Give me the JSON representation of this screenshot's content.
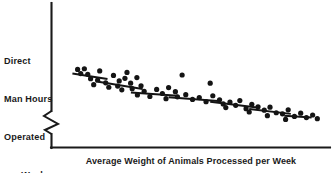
{
  "figure": {
    "background_color": "#ffffff",
    "ink_color": "#141414"
  },
  "axes": {
    "y_axis_label_lines": [
      "Direct",
      "Man Hours",
      "Operated",
      "per Week"
    ],
    "y_axis_label_full": "Direct Man Hours Operated per Week",
    "x_axis_label": "Average Weight of Animals Processed per Week",
    "y_axis_break_symbol": "zigzag",
    "y_axis_break_present": true,
    "tick_labels_x": [],
    "tick_labels_y": [],
    "grid": false
  },
  "chart_data": {
    "type": "scatter",
    "title": "",
    "xlabel": "Average Weight of Animals Processed per Week",
    "ylabel": "Direct Man Hours Operated per Week",
    "xlim": [
      0,
      100
    ],
    "ylim": [
      0,
      100
    ],
    "grid": false,
    "legend": "none",
    "axis_scale_note": "Axes are unlabeled; values are relative positions (0-100) read off the plotted pixels.",
    "relationship": "negative",
    "points": [
      {
        "x": 6.0,
        "y": 84.5
      },
      {
        "x": 8.6,
        "y": 85.5
      },
      {
        "x": 7.2,
        "y": 79.0
      },
      {
        "x": 9.9,
        "y": 78.0
      },
      {
        "x": 14.5,
        "y": 82.5
      },
      {
        "x": 11.0,
        "y": 72.0
      },
      {
        "x": 13.7,
        "y": 70.0
      },
      {
        "x": 12.2,
        "y": 64.0
      },
      {
        "x": 16.8,
        "y": 66.5
      },
      {
        "x": 19.8,
        "y": 76.5
      },
      {
        "x": 22.0,
        "y": 69.0
      },
      {
        "x": 25.0,
        "y": 80.5
      },
      {
        "x": 18.0,
        "y": 60.5
      },
      {
        "x": 21.4,
        "y": 62.0
      },
      {
        "x": 24.2,
        "y": 72.5
      },
      {
        "x": 26.4,
        "y": 66.0
      },
      {
        "x": 28.8,
        "y": 73.5
      },
      {
        "x": 23.0,
        "y": 57.0
      },
      {
        "x": 27.0,
        "y": 58.5
      },
      {
        "x": 30.4,
        "y": 62.5
      },
      {
        "x": 31.6,
        "y": 55.0
      },
      {
        "x": 29.0,
        "y": 50.0
      },
      {
        "x": 33.8,
        "y": 48.0
      },
      {
        "x": 36.4,
        "y": 57.5
      },
      {
        "x": 38.6,
        "y": 52.0
      },
      {
        "x": 41.0,
        "y": 60.0
      },
      {
        "x": 43.6,
        "y": 54.5
      },
      {
        "x": 46.2,
        "y": 77.0
      },
      {
        "x": 40.0,
        "y": 45.0
      },
      {
        "x": 44.4,
        "y": 47.5
      },
      {
        "x": 47.6,
        "y": 50.5
      },
      {
        "x": 50.2,
        "y": 44.0
      },
      {
        "x": 52.8,
        "y": 46.5
      },
      {
        "x": 55.4,
        "y": 41.0
      },
      {
        "x": 58.0,
        "y": 49.0
      },
      {
        "x": 57.0,
        "y": 66.0
      },
      {
        "x": 60.6,
        "y": 43.5
      },
      {
        "x": 62.0,
        "y": 38.0
      },
      {
        "x": 64.6,
        "y": 40.5
      },
      {
        "x": 63.0,
        "y": 33.0
      },
      {
        "x": 66.8,
        "y": 36.0
      },
      {
        "x": 68.4,
        "y": 42.5
      },
      {
        "x": 70.8,
        "y": 31.5
      },
      {
        "x": 73.0,
        "y": 37.5
      },
      {
        "x": 75.4,
        "y": 34.0
      },
      {
        "x": 72.0,
        "y": 27.0
      },
      {
        "x": 77.8,
        "y": 29.5
      },
      {
        "x": 80.0,
        "y": 33.5
      },
      {
        "x": 82.4,
        "y": 26.0
      },
      {
        "x": 79.0,
        "y": 22.0
      },
      {
        "x": 84.8,
        "y": 24.5
      },
      {
        "x": 87.0,
        "y": 30.0
      },
      {
        "x": 89.4,
        "y": 21.0
      },
      {
        "x": 86.0,
        "y": 17.0
      },
      {
        "x": 91.8,
        "y": 25.5
      },
      {
        "x": 94.0,
        "y": 19.5
      },
      {
        "x": 96.4,
        "y": 23.0
      },
      {
        "x": 98.2,
        "y": 18.0
      }
    ],
    "trend_segments": [
      {
        "x1": 4.0,
        "y1": 79.0,
        "x2": 17.5,
        "y2": 71.5
      },
      {
        "x1": 14.0,
        "y1": 68.0,
        "x2": 31.0,
        "y2": 58.0
      },
      {
        "x1": 26.5,
        "y1": 53.5,
        "x2": 44.5,
        "y2": 49.0
      },
      {
        "x1": 41.0,
        "y1": 47.0,
        "x2": 60.0,
        "y2": 42.0
      },
      {
        "x1": 57.0,
        "y1": 41.0,
        "x2": 75.0,
        "y2": 33.0
      },
      {
        "x1": 72.0,
        "y1": 31.0,
        "x2": 88.0,
        "y2": 24.5
      },
      {
        "x1": 85.5,
        "y1": 22.0,
        "x2": 96.0,
        "y2": 19.5
      }
    ]
  }
}
